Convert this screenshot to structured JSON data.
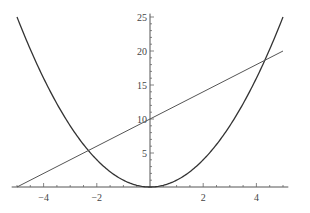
{
  "chart_data": {
    "type": "line",
    "title": "",
    "xlabel": "",
    "ylabel": "",
    "xlim": [
      -5.2,
      5.2
    ],
    "ylim": [
      0,
      25.5
    ],
    "grid": false,
    "legend": null,
    "x_ticks": [
      -4,
      -2,
      2,
      4
    ],
    "x_tick_labels": [
      "−4",
      "−2",
      "2",
      "4"
    ],
    "y_ticks": [
      5,
      10,
      15,
      20,
      25
    ],
    "y_tick_labels": [
      "5",
      "10",
      "15",
      "20",
      "25"
    ],
    "series": [
      {
        "name": "x^2",
        "expression": "y = x^2",
        "x": [
          -5,
          -4,
          -3,
          -2,
          -1,
          0,
          1,
          2,
          3,
          4,
          5
        ],
        "values": [
          25,
          16,
          9,
          4,
          1,
          0,
          1,
          4,
          9,
          16,
          25
        ],
        "color": "#333333"
      },
      {
        "name": "2x+10",
        "expression": "y = 2x + 10",
        "x": [
          -5,
          5
        ],
        "values": [
          0,
          20
        ],
        "color": "#555555"
      }
    ]
  }
}
